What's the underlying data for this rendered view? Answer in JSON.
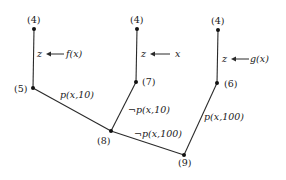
{
  "diagram": {
    "type": "proof-tree / connection graph",
    "nodes": [
      {
        "id": "n4a",
        "label": "(4)"
      },
      {
        "id": "n5",
        "label": "(5)"
      },
      {
        "id": "n4b",
        "label": "(4)"
      },
      {
        "id": "n7",
        "label": "(7)"
      },
      {
        "id": "n4c",
        "label": "(4)"
      },
      {
        "id": "n6",
        "label": "(6)"
      },
      {
        "id": "n8",
        "label": "(8)"
      },
      {
        "id": "n9",
        "label": "(9)"
      }
    ],
    "substitutions": [
      {
        "var": "z",
        "value": "f(x)"
      },
      {
        "var": "z",
        "value": "x"
      },
      {
        "var": "z",
        "value": "g(x)"
      }
    ],
    "edges": [
      {
        "from": "(4)",
        "to": "(5)",
        "label": ""
      },
      {
        "from": "(4)",
        "to": "(7)",
        "label": ""
      },
      {
        "from": "(4)",
        "to": "(6)",
        "label": ""
      },
      {
        "from": "(5)",
        "to": "(8)",
        "label": "p(x,10)"
      },
      {
        "from": "(7)",
        "to": "(8)",
        "label": "¬p(x,10)"
      },
      {
        "from": "(8)",
        "to": "(9)",
        "label": "¬p(x,100)"
      },
      {
        "from": "(6)",
        "to": "(9)",
        "label": "p(x,100)"
      }
    ],
    "edge_labels": {
      "e58": "p(x,10)",
      "e78": "¬p(x,10)",
      "e89": "¬p(x,100)",
      "e69": "p(x,100)"
    }
  }
}
